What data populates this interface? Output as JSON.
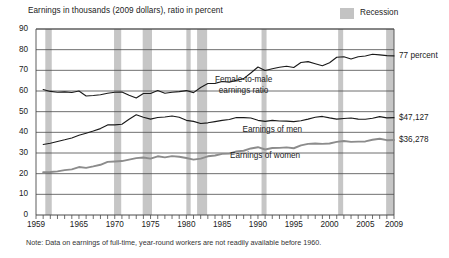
{
  "chart_data": {
    "type": "line",
    "title": "Earnings in thousands (2009 dollars), ratio in percent",
    "xlabel": "",
    "ylabel": "",
    "ylim": [
      0,
      90
    ],
    "xlim": [
      1959,
      2009
    ],
    "grid": true,
    "y_ticks": [
      "0",
      "10",
      "20",
      "30",
      "40",
      "50",
      "60",
      "70",
      "80",
      "90"
    ],
    "x_ticks": [
      "1959",
      "1965",
      "1970",
      "1975",
      "1980",
      "1985",
      "1990",
      "1995",
      "2000",
      "2005",
      "2009"
    ],
    "legend": {
      "position": "top-right",
      "entries": [
        "Recession"
      ]
    },
    "note": "Note: Data on earnings of full-time, year-round workers are not readily available before 1960.",
    "x": [
      1960,
      1961,
      1962,
      1963,
      1964,
      1965,
      1966,
      1967,
      1968,
      1969,
      1970,
      1971,
      1972,
      1973,
      1974,
      1975,
      1976,
      1977,
      1978,
      1979,
      1980,
      1981,
      1982,
      1983,
      1984,
      1985,
      1986,
      1987,
      1988,
      1989,
      1990,
      1991,
      1992,
      1993,
      1994,
      1995,
      1996,
      1997,
      1998,
      1999,
      2000,
      2001,
      2002,
      2003,
      2004,
      2005,
      2006,
      2007,
      2008,
      2009
    ],
    "series": [
      {
        "name": "Female-to-male earnings ratio",
        "unit": "percent",
        "end_label": "77 percent",
        "color": "#1a1a1a",
        "values": [
          60.7,
          59.8,
          59.4,
          59.6,
          59.3,
          60.0,
          57.6,
          57.8,
          58.2,
          58.9,
          59.4,
          59.5,
          57.9,
          56.6,
          58.8,
          58.8,
          60.2,
          58.9,
          59.4,
          59.7,
          60.2,
          59.2,
          61.7,
          63.6,
          63.7,
          64.6,
          64.3,
          65.2,
          66.0,
          68.7,
          71.6,
          69.9,
          70.8,
          71.5,
          72.0,
          71.4,
          73.8,
          74.2,
          73.2,
          72.2,
          73.7,
          76.3,
          76.6,
          75.5,
          76.6,
          76.9,
          77.8,
          77.5,
          77.1,
          77.0
        ]
      },
      {
        "name": "Earnings of men",
        "unit": "thousands of 2009 dollars",
        "end_label": "$47,127",
        "color": "#1a1a1a",
        "values": [
          34.1,
          34.7,
          35.6,
          36.4,
          37.3,
          38.6,
          39.6,
          40.6,
          41.8,
          43.6,
          43.6,
          43.9,
          46.3,
          48.5,
          47.3,
          46.4,
          47.2,
          47.4,
          47.9,
          47.3,
          45.8,
          45.3,
          44.3,
          44.6,
          45.2,
          45.8,
          46.2,
          47.2,
          47.1,
          46.9,
          45.8,
          45.3,
          45.8,
          45.5,
          45.4,
          45.2,
          45.6,
          46.4,
          47.3,
          47.7,
          47.0,
          46.4,
          46.7,
          46.9,
          46.4,
          46.3,
          46.8,
          47.6,
          47.0,
          47.1
        ]
      },
      {
        "name": "Earnings of women",
        "unit": "thousands of 2009 dollars",
        "end_label": "$36,278",
        "color": "#8c8c8c",
        "values": [
          20.7,
          20.8,
          21.1,
          21.7,
          22.1,
          23.2,
          22.8,
          23.5,
          24.3,
          25.7,
          25.9,
          26.1,
          26.8,
          27.5,
          27.8,
          27.3,
          28.4,
          27.9,
          28.5,
          28.2,
          27.6,
          26.8,
          27.3,
          28.4,
          28.8,
          29.6,
          29.7,
          30.8,
          31.1,
          32.2,
          32.8,
          31.7,
          32.4,
          32.5,
          32.7,
          32.3,
          33.7,
          34.4,
          34.6,
          34.4,
          34.6,
          35.4,
          35.8,
          35.4,
          35.5,
          35.6,
          36.4,
          36.9,
          36.2,
          36.3
        ]
      }
    ],
    "recessions": [
      {
        "start": 1960.3,
        "end": 1961.2
      },
      {
        "start": 1969.9,
        "end": 1970.9
      },
      {
        "start": 1973.9,
        "end": 1975.2
      },
      {
        "start": 1980.0,
        "end": 1980.6
      },
      {
        "start": 1981.5,
        "end": 1982.9
      },
      {
        "start": 1990.5,
        "end": 1991.2
      },
      {
        "start": 2001.2,
        "end": 2001.9
      },
      {
        "start": 2007.9,
        "end": 2009.4
      }
    ],
    "annotations": [
      {
        "text": "77 percent",
        "series": "Female-to-male earnings ratio"
      },
      {
        "text": "$47,127",
        "series": "Earnings of men"
      },
      {
        "text": "$36,278",
        "series": "Earnings of women"
      }
    ]
  }
}
